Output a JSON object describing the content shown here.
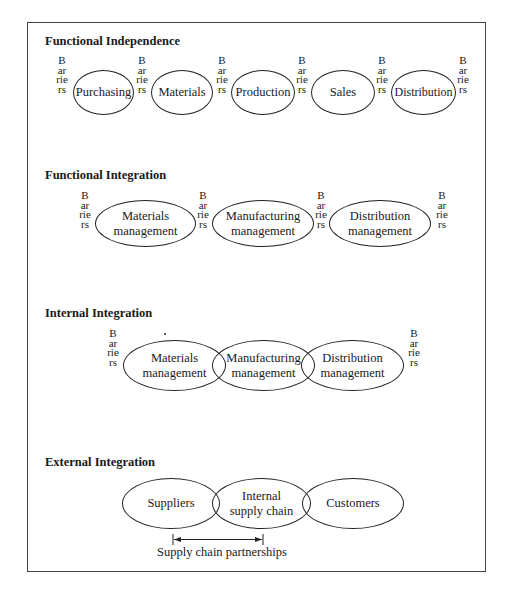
{
  "barrier_label": "Barriers",
  "sections": [
    {
      "title": "Functional Independence",
      "nodes": [
        "Purchasing",
        "Materials",
        "Production",
        "Sales",
        "Distribution"
      ]
    },
    {
      "title": "Functional Integration",
      "nodes": [
        "Materials\nmanagement",
        "Manufacturing\nmanagement",
        "Distribution\nmanagement"
      ]
    },
    {
      "title": "Internal Integration",
      "nodes": [
        "Materials\nmanagement",
        "Manufacturing\nmanagement",
        "Distribution\nmanagement"
      ]
    },
    {
      "title": "External Integration",
      "nodes": [
        "Suppliers",
        "Internal\nsupply chain",
        "Customers"
      ],
      "arrow_label": "Supply chain partnerships"
    }
  ],
  "colors": {
    "line": "#222222",
    "frame": "#444444",
    "text": "#1a1a1a",
    "background": "#ffffff"
  }
}
